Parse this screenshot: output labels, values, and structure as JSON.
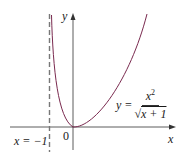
{
  "figure": {
    "type": "function-graph",
    "function": "y = x^2 / sqrt(x + 1)",
    "labels": {
      "x_axis": "x",
      "y_axis": "y",
      "origin": "0",
      "asymptote": "x = −1",
      "equation_lhs": "y =",
      "equation_num_base": "x",
      "equation_num_exp": "2",
      "equation_den": "x + 1"
    },
    "colors": {
      "curve": "#7a2a4f",
      "axes": "#333333",
      "asymptote": "#777777"
    },
    "asymptote_x": -1,
    "domain": "x > -1",
    "min_point": [
      0,
      0
    ]
  }
}
